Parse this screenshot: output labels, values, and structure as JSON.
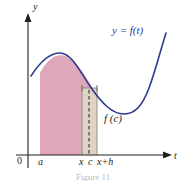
{
  "figure": {
    "title_caption": "Figure 11",
    "axes": {
      "x_axis_label": "t",
      "y_axis_label": "y",
      "origin_label": "0"
    },
    "curve": {
      "label": "y = f(t)",
      "color": "#2b3a8f"
    },
    "rectangle": {
      "height_label": "f (c)",
      "fill_color": "#ded5c8"
    },
    "region": {
      "fill_color": "#e0a6b9"
    },
    "tick_labels": [
      {
        "name": "a",
        "text": "a"
      },
      {
        "name": "x",
        "text": "x"
      },
      {
        "name": "c",
        "text": "c"
      },
      {
        "name": "xph",
        "text": "x+h"
      }
    ]
  }
}
